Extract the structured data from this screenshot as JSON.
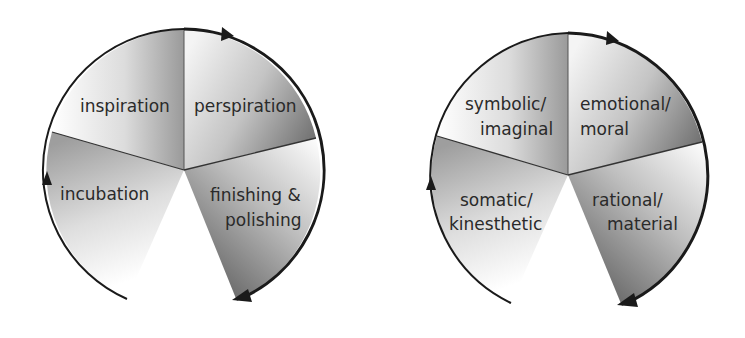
{
  "diagrams": [
    {
      "name": "creative-process-cycle",
      "segments": [
        {
          "label_lines": [
            "inspiration"
          ]
        },
        {
          "label_lines": [
            "perspiration"
          ]
        },
        {
          "label_lines": [
            "finishing &",
            "polishing"
          ]
        },
        {
          "label_lines": [
            "incubation"
          ]
        }
      ],
      "direction": "clockwise"
    },
    {
      "name": "modes-of-knowing-cycle",
      "segments": [
        {
          "label_lines": [
            "symbolic/",
            "imaginal"
          ]
        },
        {
          "label_lines": [
            "emotional/",
            "moral"
          ]
        },
        {
          "label_lines": [
            "rational/",
            "material"
          ]
        },
        {
          "label_lines": [
            "somatic/",
            "kinesthetic"
          ]
        }
      ],
      "direction": "clockwise"
    }
  ],
  "colors": {
    "background": "#ffffff",
    "segment_dark": "#8a8a8a",
    "segment_light": "#ffffff",
    "outline": "#1a1a1a",
    "text": "#2a2a2a"
  }
}
